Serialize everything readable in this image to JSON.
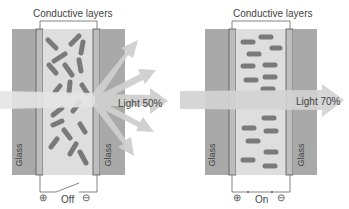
{
  "panels": [
    {
      "state": "off",
      "title": "Conductive layers",
      "glass_left": "Glass",
      "glass_right": "Glass",
      "light_label": "Light 50%",
      "switch_label": "Off",
      "plus": "⊕",
      "minus": "⊖"
    },
    {
      "state": "on",
      "title": "Conductive layers",
      "glass_left": "Glass",
      "glass_right": "Glass",
      "light_label": "Light 70%",
      "switch_label": "On",
      "plus": "⊕",
      "minus": "⊖"
    }
  ],
  "colors": {
    "glass": "#a9a9a9",
    "cell": "#d9d9d9",
    "conductive": "#bdbdbd",
    "particle": "#7a7a7a",
    "arrow": "#cfcfcf"
  }
}
